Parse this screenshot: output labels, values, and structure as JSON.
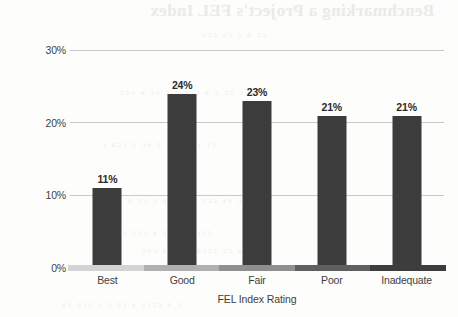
{
  "chart_data": {
    "type": "bar",
    "title": "",
    "xlabel": "FEL Index Rating",
    "ylabel": "Percentage of Projects",
    "categories": [
      "Best",
      "Good",
      "Fair",
      "Poor",
      "Inadequate"
    ],
    "values": [
      11,
      24,
      23,
      21,
      21
    ],
    "value_labels": [
      "11%",
      "24%",
      "23%",
      "21%",
      "21%"
    ],
    "ylim": [
      0,
      32
    ],
    "yticks": [
      0,
      10,
      20,
      30
    ],
    "ytick_labels": [
      "0%",
      "10%",
      "20%",
      "30%"
    ],
    "grid": "horizontal",
    "legend": "none",
    "bar_color": "#3c3c3c",
    "gridline_color": "#c9c9c9",
    "axis_scale_segments": [
      "#d3d3d3",
      "#b0b0b0",
      "#8f8f8f",
      "#5f5f5f",
      "#3d3d3d"
    ]
  },
  "artifacts": {
    "bleed_title": "Benchmarking a Project's FEL Index",
    "bleed_lines": [
      "a c cc   c a ccc  c    c cc a ccc",
      "cc c a  ccc   c ac c  cca  c",
      "c aa ccc   a cc  ca c  cc a",
      "ccc a  c cc  a  ccc c a cc",
      "a cc  ccca  c  cc a ccc",
      "c a cccc  a cc  c a  ccc  ca",
      "cc a  c  ca ccc"
    ]
  }
}
